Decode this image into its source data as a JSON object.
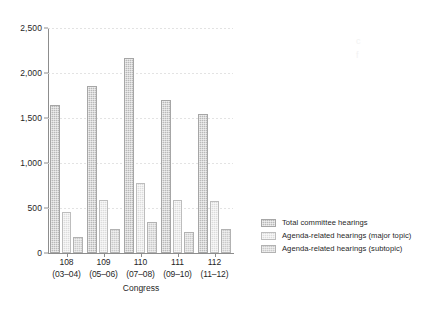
{
  "chart_data": {
    "type": "bar",
    "title": "",
    "xlabel": "Congress",
    "ylabel": "",
    "categories": [
      "108",
      "109",
      "110",
      "111",
      "112"
    ],
    "category_sublabels": [
      "(03–04)",
      "(05–06)",
      "(07–08)",
      "(09–10)",
      "(11–12)"
    ],
    "ylim": [
      0,
      2500
    ],
    "ytick_labels": [
      "0",
      "500",
      "1,000",
      "1,500",
      "2,000",
      "2,500"
    ],
    "ytick_values": [
      0,
      500,
      1000,
      1500,
      2000,
      2500
    ],
    "grid": true,
    "grid_axis": "y",
    "legend_position": "right",
    "series": [
      {
        "name": "Total committee hearings",
        "color": "#b9b9b9",
        "values": [
          1640,
          1860,
          2170,
          1705,
          1540
        ]
      },
      {
        "name": "Agenda-related hearings (major topic)",
        "color": "#dcdcdc",
        "values": [
          455,
          585,
          780,
          590,
          580
        ]
      },
      {
        "name": "Agenda-related hearings (subtopic)",
        "color": "#cacaca",
        "values": [
          180,
          265,
          350,
          235,
          265
        ]
      }
    ]
  }
}
